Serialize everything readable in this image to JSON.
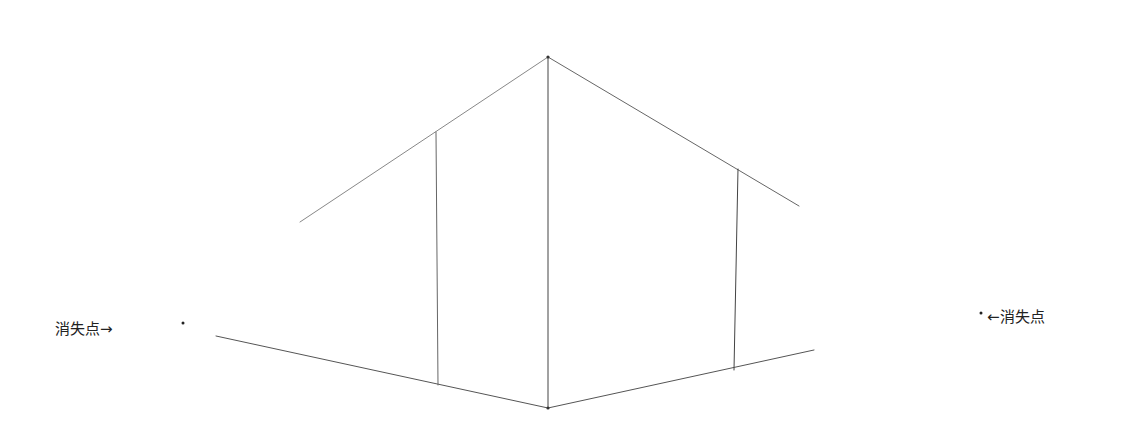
{
  "diagram": {
    "type": "two-point perspective sketch",
    "labels": {
      "left_vanishing_point": "消失点→",
      "right_vanishing_point": "←消失点"
    },
    "colors": {
      "background": "#ffffff",
      "line": "#555555",
      "text": "#222222"
    },
    "points": {
      "left_vp": [
        183,
        323
      ],
      "right_vp": [
        981,
        313
      ],
      "top": [
        548,
        57
      ],
      "bottom": [
        548,
        408
      ]
    },
    "lines": [
      {
        "name": "front-vertical-edge",
        "x1": 548,
        "y1": 57,
        "x2": 548,
        "y2": 408
      },
      {
        "name": "roof-left-edge",
        "x1": 548,
        "y1": 57,
        "x2": 300,
        "y2": 222
      },
      {
        "name": "roof-right-edge",
        "x1": 548,
        "y1": 57,
        "x2": 799,
        "y2": 206
      },
      {
        "name": "base-left-edge",
        "x1": 548,
        "y1": 408,
        "x2": 216,
        "y2": 336
      },
      {
        "name": "base-right-edge",
        "x1": 548,
        "y1": 408,
        "x2": 814,
        "y2": 350
      },
      {
        "name": "left-wall-vertical",
        "x1": 436,
        "y1": 132,
        "x2": 438,
        "y2": 385
      },
      {
        "name": "right-wall-vertical",
        "x1": 738,
        "y1": 169,
        "x2": 734,
        "y2": 370
      }
    ]
  }
}
